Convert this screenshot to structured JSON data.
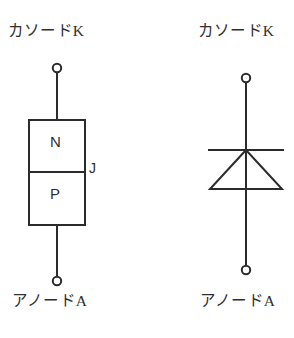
{
  "figure": {
    "background_color": "#ffffff",
    "stroke_color": "#2b2b2b",
    "diagrams": [
      {
        "id": "pn-structure",
        "name": "pn-junction-structure",
        "top_terminal_label": "カソードK",
        "bottom_terminal_label": "アノードA",
        "region_top_label": "N",
        "region_bottom_label": "P",
        "junction_label": "J"
      },
      {
        "id": "diode-symbol",
        "name": "diode-circuit-symbol",
        "top_terminal_label": "カソードK",
        "bottom_terminal_label": "アノードA"
      }
    ]
  },
  "labels": {
    "cathode_left": "カソードK",
    "cathode_right": "カソードK",
    "anode_left": "アノードA",
    "anode_right": "アノードA",
    "n_region": "N",
    "p_region": "P",
    "junction": "J"
  },
  "colors": {
    "ink": "#2b2b2b",
    "paper": "#ffffff"
  }
}
